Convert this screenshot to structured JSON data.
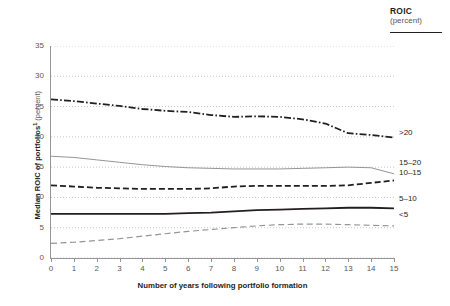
{
  "legend_header": {
    "title": "ROIC",
    "subtitle": "(percent)"
  },
  "axes": {
    "y_title": "Median ROIC of portfolios",
    "y_unit": "(percent)",
    "x_title": "Number of years following portfolio formation",
    "y_ticks": [
      "0",
      "5",
      "10",
      "15",
      "20",
      "25",
      "30",
      "35"
    ],
    "x_ticks": [
      "0",
      "1",
      "2",
      "3",
      "4",
      "5",
      "6",
      "7",
      "8",
      "9",
      "10",
      "11",
      "12",
      "13",
      "14",
      "15"
    ]
  },
  "series_labels": {
    "gt20": ">20",
    "s15_20": "15–20",
    "s10_15": "10–15",
    "s5_10": "5–10",
    "lt5": "<5"
  },
  "colors": {
    "ink": "#231f20",
    "grey_text": "#58585b",
    "axis": "#939598",
    "grid": "#c7c8ca",
    "line_dark": "#231f20",
    "line_mid": "#6d6e71",
    "line_light": "#939598"
  },
  "chart_data": {
    "type": "line",
    "title": "",
    "xlabel": "Number of years following portfolio formation",
    "ylabel": "Median ROIC of portfolios (percent)",
    "xlim": [
      0,
      15
    ],
    "ylim": [
      0,
      35
    ],
    "grid": true,
    "legend_position": "right-end-labels",
    "legend_title": "ROIC (percent)",
    "x": [
      0,
      1,
      2,
      3,
      4,
      5,
      6,
      7,
      8,
      9,
      10,
      11,
      12,
      13,
      14,
      15
    ],
    "series": [
      {
        "name": ">20",
        "style": "dash-dot",
        "color": "#231f20",
        "values": [
          26.2,
          25.9,
          25.5,
          25.1,
          24.6,
          24.3,
          24.1,
          23.6,
          23.3,
          23.4,
          23.3,
          22.9,
          22.2,
          20.6,
          20.3,
          19.9
        ]
      },
      {
        "name": "15–20",
        "style": "solid",
        "color": "#939598",
        "values": [
          16.8,
          16.6,
          16.2,
          15.8,
          15.4,
          15.1,
          14.9,
          14.8,
          14.7,
          14.7,
          14.7,
          14.8,
          14.9,
          15.0,
          14.9,
          13.9
        ]
      },
      {
        "name": "10–15",
        "style": "dashed",
        "color": "#231f20",
        "values": [
          12.0,
          11.8,
          11.6,
          11.5,
          11.4,
          11.4,
          11.4,
          11.5,
          11.8,
          11.9,
          11.9,
          11.9,
          11.9,
          12.0,
          12.4,
          12.8
        ]
      },
      {
        "name": "5–10",
        "style": "solid-bold",
        "color": "#231f20",
        "values": [
          7.3,
          7.3,
          7.3,
          7.3,
          7.3,
          7.3,
          7.4,
          7.5,
          7.7,
          7.9,
          8.0,
          8.1,
          8.2,
          8.3,
          8.3,
          8.2
        ]
      },
      {
        "name": "<5",
        "style": "dashed-light",
        "color": "#939598",
        "values": [
          2.4,
          2.6,
          2.9,
          3.2,
          3.6,
          4.0,
          4.4,
          4.7,
          5.0,
          5.3,
          5.5,
          5.6,
          5.6,
          5.5,
          5.4,
          5.3
        ]
      }
    ]
  }
}
